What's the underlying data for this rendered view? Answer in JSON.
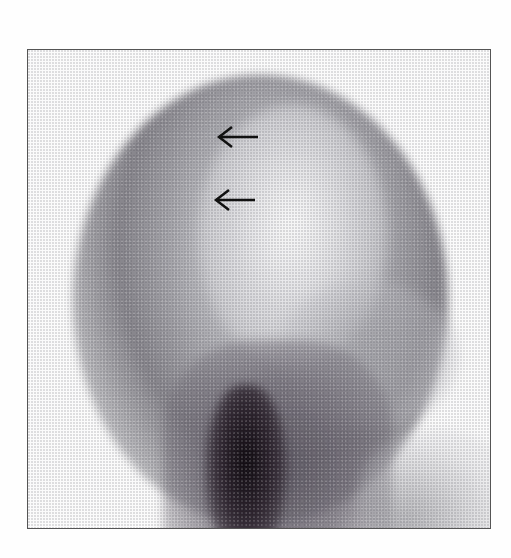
{
  "image": {
    "description": "Grayscale nuclear medicine (scintigraphy) image of the head and neck, lateral view",
    "annotations": [
      {
        "type": "arrow",
        "direction": "left",
        "icon": "left-arrow-icon",
        "x": 237,
        "y": 137
      },
      {
        "type": "arrow",
        "direction": "left",
        "icon": "left-arrow-icon",
        "x": 235,
        "y": 200
      }
    ],
    "colors": {
      "frame": "#555555",
      "background": "#fefefe",
      "arrow": "#111111"
    }
  }
}
